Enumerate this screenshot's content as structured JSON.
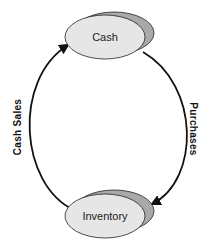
{
  "diagram": {
    "type": "cycle",
    "nodes": [
      {
        "id": "cash",
        "label": "Cash"
      },
      {
        "id": "inventory",
        "label": "Inventory"
      }
    ],
    "edges": [
      {
        "from": "cash",
        "to": "inventory",
        "label": "Purchases",
        "side": "right"
      },
      {
        "from": "inventory",
        "to": "cash",
        "label": "Cash Sales",
        "side": "left"
      }
    ],
    "colors": {
      "node_fill": "#e6e6e6",
      "node_shadow": "#a9a9a9",
      "stroke": "#111111",
      "background": "#ffffff"
    }
  }
}
